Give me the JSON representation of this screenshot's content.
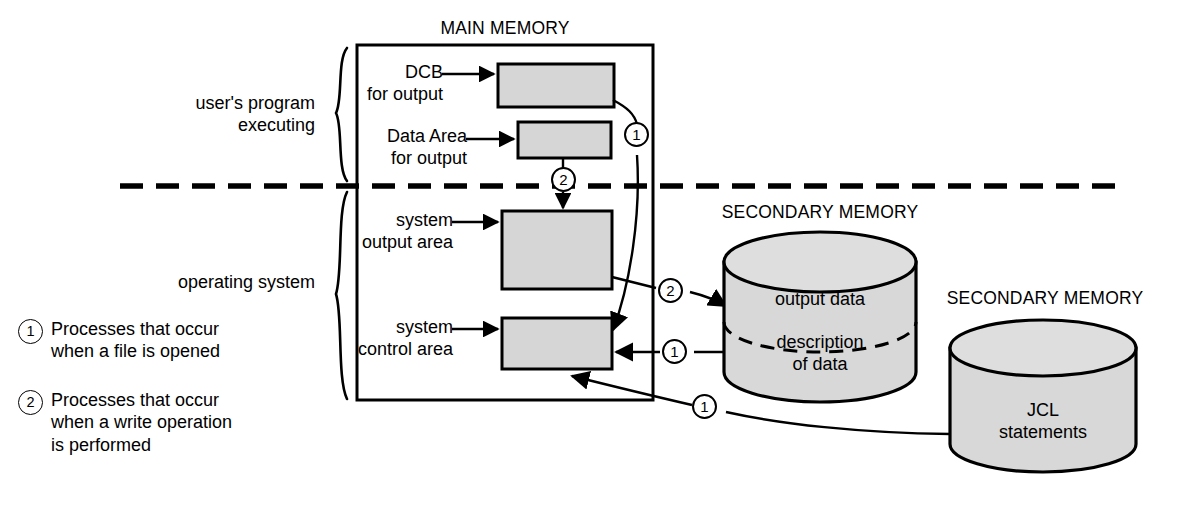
{
  "diagram": {
    "title_main_memory": "MAIN MEMORY",
    "title_secondary_memory_1": "SECONDARY MEMORY",
    "title_secondary_memory_2": "SECONDARY MEMORY",
    "colors": {
      "box_fill": "#d6d6d6",
      "cylinder_fill": "#d8d8d8",
      "stroke": "#000000",
      "background": "#ffffff"
    }
  },
  "side_labels": {
    "user_program": "user's program\nexecuting",
    "operating_system": "operating system"
  },
  "memory_blocks": [
    {
      "label": "DCB\nfor output",
      "name": "dcb-for-output"
    },
    {
      "label": "Data Area\nfor output",
      "name": "data-area-for-output"
    },
    {
      "label": "system\noutput area",
      "name": "system-output-area"
    },
    {
      "label": "system\ncontrol area",
      "name": "system-control-area"
    }
  ],
  "cylinders": {
    "data_disk": {
      "upper_label": "output data",
      "lower_label": "description\nof data"
    },
    "jcl_disk": {
      "label": "JCL\nstatements"
    }
  },
  "flow_markers": {
    "one": "1",
    "two": "2"
  },
  "legend": [
    {
      "marker": "1",
      "text": "Processes that occur\nwhen a file is opened"
    },
    {
      "marker": "2",
      "text": "Processes that occur\nwhen a write operation\nis performed"
    }
  ]
}
